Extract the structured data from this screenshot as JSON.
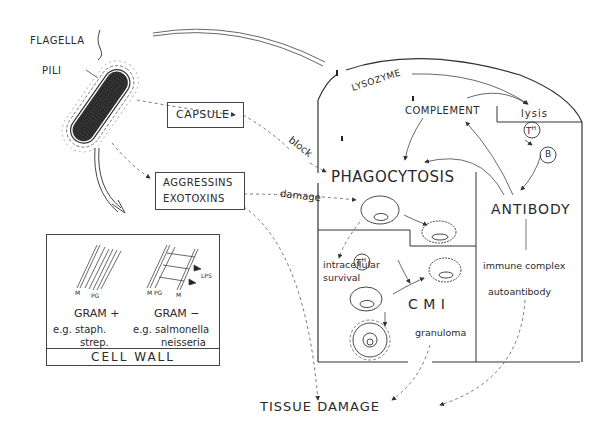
{
  "bacterium": {
    "flagella_label": "FLAGELLA",
    "pili_label": "PILI"
  },
  "virulence_factors": {
    "capsule_label": "CAPSULE",
    "aggressins_label": "AGGRESSINS",
    "exotoxins_label": "EXOTOXINS",
    "block_label": "block",
    "damage_label": "damage"
  },
  "cell_wall_panel": {
    "title": "CELL WALL",
    "gram_positive": {
      "label": "GRAM +",
      "examples_line1": "e.g. staph.",
      "examples_line2": "strep.",
      "layer_labels": [
        "M",
        "PG"
      ]
    },
    "gram_negative": {
      "label": "GRAM −",
      "examples_line1": "e.g. salmonella",
      "examples_line2": "neisseria",
      "layer_labels": [
        "M",
        "PG",
        "M",
        "LPS"
      ]
    }
  },
  "host_defense": {
    "lysozyme_label": "LYSOZYME",
    "complement_label": "COMPLEMENT",
    "lysis_label": "lysis",
    "th_label": "T",
    "th_sup": "H",
    "b_label": "B",
    "phagocytosis_label": "PHAGOCYTOSIS",
    "antibody_label": "ANTIBODY",
    "intracellular_line1": "intracellular",
    "intracellular_line2": "survival",
    "cmi_label": "C M I",
    "granuloma_label": "granuloma",
    "immune_complex_label": "immune complex",
    "autoantibody_label": "autoantibody"
  },
  "outcome": {
    "tissue_damage_label": "TISSUE DAMAGE"
  }
}
